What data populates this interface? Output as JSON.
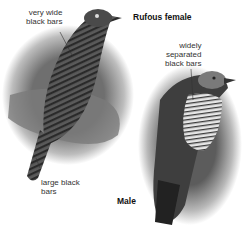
{
  "figure": {
    "female": {
      "title": "Rufous female",
      "annotations": [
        {
          "text": "very wide\nblack bars"
        },
        {
          "text": "large black\nbars"
        }
      ]
    },
    "male": {
      "title": "Male",
      "annotations": [
        {
          "text": "widely\nseparated\nblack bars"
        }
      ]
    }
  }
}
